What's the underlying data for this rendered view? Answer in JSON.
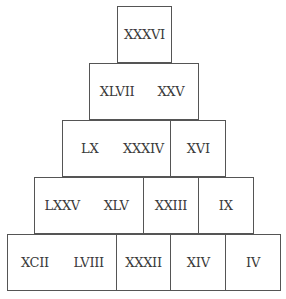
{
  "rows": [
    {
      "cells": [
        "XXXVI"
      ]
    },
    {
      "cells": [
        "XLVII",
        "XXV"
      ]
    },
    {
      "cells": [
        "LX",
        "XXXIV",
        "XVI"
      ]
    },
    {
      "cells": [
        "LXXV",
        "XLV",
        "XXIII",
        "IX"
      ]
    },
    {
      "cells": [
        "XCII",
        "LVIII",
        "XXXII",
        "XIV",
        "IV"
      ]
    }
  ]
}
